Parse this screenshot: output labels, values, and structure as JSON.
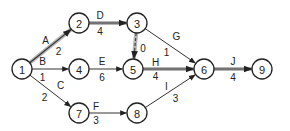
{
  "diagram": {
    "type": "activity-on-arrow network",
    "nodes": [
      {
        "id": "1",
        "label": "1"
      },
      {
        "id": "2",
        "label": "2"
      },
      {
        "id": "3",
        "label": "3"
      },
      {
        "id": "4",
        "label": "4"
      },
      {
        "id": "5",
        "label": "5"
      },
      {
        "id": "6",
        "label": "6"
      },
      {
        "id": "7",
        "label": "7"
      },
      {
        "id": "8",
        "label": "8"
      },
      {
        "id": "9",
        "label": "9"
      }
    ],
    "activities": [
      {
        "from": "1",
        "to": "2",
        "name": "A",
        "duration": "2",
        "critical": true,
        "dummy": false
      },
      {
        "from": "1",
        "to": "4",
        "name": "B",
        "duration": "1",
        "critical": false,
        "dummy": false
      },
      {
        "from": "1",
        "to": "7",
        "name": "C",
        "duration": "2",
        "critical": false,
        "dummy": false
      },
      {
        "from": "2",
        "to": "3",
        "name": "D",
        "duration": "4",
        "critical": true,
        "dummy": false
      },
      {
        "from": "4",
        "to": "5",
        "name": "E",
        "duration": "6",
        "critical": false,
        "dummy": false
      },
      {
        "from": "7",
        "to": "8",
        "name": "F",
        "duration": "3",
        "critical": false,
        "dummy": false
      },
      {
        "from": "3",
        "to": "6",
        "name": "G",
        "duration": "1",
        "critical": false,
        "dummy": false
      },
      {
        "from": "3",
        "to": "5",
        "name": "",
        "duration": "0",
        "critical": true,
        "dummy": true
      },
      {
        "from": "5",
        "to": "6",
        "name": "H",
        "duration": "4",
        "critical": true,
        "dummy": false
      },
      {
        "from": "8",
        "to": "6",
        "name": "I",
        "duration": "3",
        "critical": false,
        "dummy": false
      },
      {
        "from": "6",
        "to": "9",
        "name": "J",
        "duration": "4",
        "critical": true,
        "dummy": false
      }
    ],
    "colors": {
      "stroke": "#333333",
      "critical_highlight": "#b5b5b5",
      "background": "#ffffff"
    }
  }
}
